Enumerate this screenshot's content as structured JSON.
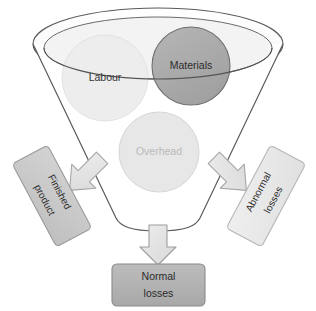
{
  "diagram": {
    "type": "funnel-process-diagram",
    "background_color": "#ffffff",
    "funnel": {
      "name": "process-funnel",
      "fill": "#ffffff",
      "stroke": "#5a5a5a",
      "rim_outer_fill": "#ffffff",
      "rim_inner_fill": "#f2f2f2"
    },
    "inputs": [
      {
        "id": "labour",
        "label": "Labour",
        "shape": "circle",
        "fill": "#ededed",
        "stroke": "#e0e0e0",
        "text_color": "#333333",
        "cx": 105,
        "cy": 78,
        "r": 43
      },
      {
        "id": "materials",
        "label": "Materials",
        "shape": "circle",
        "fill": "#a9a9a9",
        "stroke": "#6e6e6e",
        "text_color": "#2b2b2b",
        "cx": 191,
        "cy": 66,
        "r": 39
      },
      {
        "id": "overhead",
        "label": "Overhead",
        "shape": "circle",
        "fill": "#e6e6e6",
        "stroke": "#d6d6d6",
        "text_color": "#b8b8b8",
        "cx": 159,
        "cy": 152,
        "r": 40
      }
    ],
    "outputs": [
      {
        "id": "finished-product",
        "label_line1": "Finished",
        "label_line2": "product",
        "fill": "#c9c9c9",
        "stroke": "#9a9a9a",
        "text_color": "#2f2f2f",
        "rotation_deg": 62
      },
      {
        "id": "abnormal-losses",
        "label_line1": "Abnormal",
        "label_line2": "losses",
        "fill": "#e8e8e8",
        "stroke": "#b5b5b5",
        "text_color": "#2f2f2f",
        "rotation_deg": -62
      },
      {
        "id": "normal-losses",
        "label_line1": "Normal",
        "label_line2": "losses",
        "fill": "#b3b3b3",
        "stroke": "#8a8a8a",
        "text_color": "#2b2b2b",
        "rotation_deg": 0
      }
    ],
    "arrows": [
      {
        "id": "arrow-left",
        "direction": "down-left",
        "fill": "#e3e3e3",
        "stroke": "#a6a6a6"
      },
      {
        "id": "arrow-right",
        "direction": "down-right",
        "fill": "#e3e3e3",
        "stroke": "#a6a6a6"
      },
      {
        "id": "arrow-bottom",
        "direction": "down",
        "fill": "#d4d4d4",
        "stroke": "#9e9e9e"
      }
    ]
  }
}
